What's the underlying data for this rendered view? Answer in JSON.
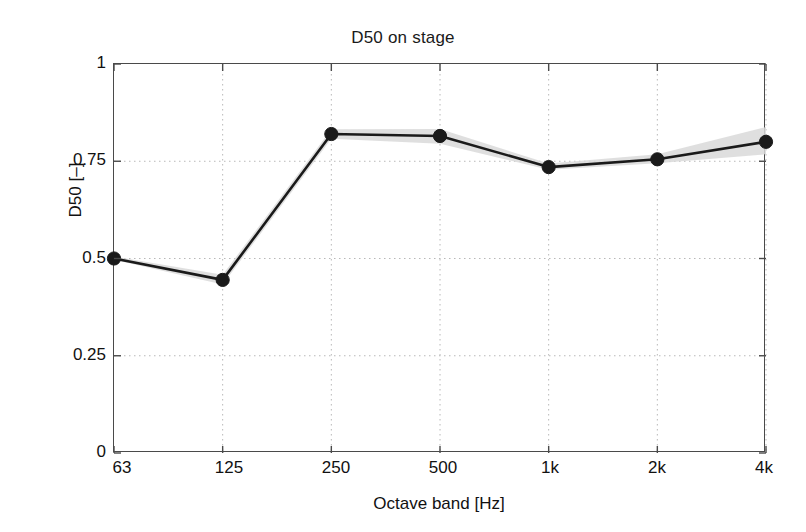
{
  "chart_data": {
    "type": "line",
    "title": "D50 on stage",
    "xlabel": "Octave band [Hz]",
    "ylabel": "D50 [–]",
    "categories": [
      "63",
      "125",
      "250",
      "500",
      "1k",
      "2k",
      "4k"
    ],
    "values": [
      0.5,
      0.445,
      0.82,
      0.815,
      0.735,
      0.755,
      0.8
    ],
    "series": [
      {
        "name": "D50 mean",
        "values": [
          0.5,
          0.445,
          0.82,
          0.815,
          0.735,
          0.755,
          0.8
        ],
        "color": "#1a1a1a",
        "marker": "filled-circle"
      },
      {
        "name": "spread band",
        "upper": [
          0.505,
          0.458,
          0.832,
          0.833,
          0.744,
          0.768,
          0.838
        ],
        "lower": [
          0.497,
          0.433,
          0.808,
          0.795,
          0.728,
          0.745,
          0.768
        ],
        "color": "#d9d9d9"
      }
    ],
    "ylim": [
      0,
      1
    ],
    "yticks": [
      "0",
      "0.25",
      "0.5",
      "0.75",
      "1"
    ],
    "ytick_values": [
      0,
      0.25,
      0.5,
      0.75,
      1
    ],
    "xticks": [
      "63",
      "125",
      "250",
      "500",
      "1k",
      "2k",
      "4k"
    ],
    "grid": true,
    "grid_style": "dotted",
    "grid_color": "#b8b8b8",
    "legend": null,
    "legend_position": "none",
    "axis_color": "#4a4a4a",
    "background": "#ffffff"
  },
  "figure": {
    "title": "D50 on stage",
    "xlabel": "Octave band [Hz]",
    "ylabel": "D50 [–]"
  }
}
